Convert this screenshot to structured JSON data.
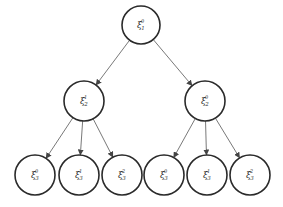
{
  "diagram": {
    "type": "tree",
    "nodes": [
      {
        "id": "root",
        "symbol": "ξ",
        "sup": "0",
        "sub": "1",
        "cx": 141,
        "cy": 25,
        "r": 19
      },
      {
        "id": "l2a",
        "symbol": "ξ",
        "sup": "1",
        "sub": "2",
        "cx": 84,
        "cy": 101,
        "r": 20
      },
      {
        "id": "l2b",
        "symbol": "ξ",
        "sup": "0",
        "sub": "2",
        "cx": 205,
        "cy": 101,
        "r": 20
      },
      {
        "id": "l3a",
        "symbol": "ξ",
        "sup": "0",
        "sub": "3",
        "cx": 35,
        "cy": 175,
        "r": 20
      },
      {
        "id": "l3b",
        "symbol": "ξ",
        "sup": "1",
        "sub": "3",
        "cx": 79,
        "cy": 175,
        "r": 20
      },
      {
        "id": "l3c",
        "symbol": "ξ",
        "sup": "2",
        "sub": "3",
        "cx": 122,
        "cy": 175,
        "r": 20
      },
      {
        "id": "l3d",
        "symbol": "ξ",
        "sup": "0",
        "sub": "3",
        "cx": 164,
        "cy": 175,
        "r": 20
      },
      {
        "id": "l3e",
        "symbol": "ξ",
        "sup": "1",
        "sub": "3",
        "cx": 207,
        "cy": 175,
        "r": 20
      },
      {
        "id": "l3f",
        "symbol": "ξ",
        "sup": "2",
        "sub": "3",
        "cx": 250,
        "cy": 175,
        "r": 20
      }
    ],
    "edges": [
      {
        "from": "root",
        "to": "l2a"
      },
      {
        "from": "root",
        "to": "l2b"
      },
      {
        "from": "l2a",
        "to": "l3a"
      },
      {
        "from": "l2a",
        "to": "l3b"
      },
      {
        "from": "l2a",
        "to": "l3c"
      },
      {
        "from": "l2b",
        "to": "l3d"
      },
      {
        "from": "l2b",
        "to": "l3e"
      },
      {
        "from": "l2b",
        "to": "l3f"
      }
    ],
    "colors": {
      "stroke": "#2a2a2a",
      "edge": "#555555",
      "background": "#ffffff"
    }
  }
}
